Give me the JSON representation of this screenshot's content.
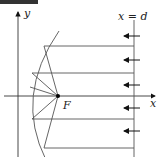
{
  "diagram": {
    "axes": {
      "x_label": "x",
      "y_label": "y"
    },
    "directrix_label": "x = d",
    "focus_label": "F",
    "colors": {
      "line": "#555555",
      "axis": "#333333",
      "arrow": "#111111",
      "focus": "#000000"
    },
    "ray_count": 4,
    "arrow_count": 5
  }
}
